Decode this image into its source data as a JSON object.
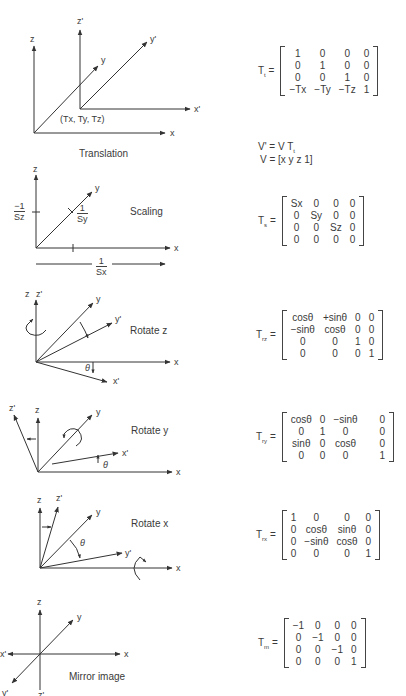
{
  "panels": {
    "translation": {
      "label": "Translation",
      "axis_labels": {
        "z": "z",
        "zp": "z'",
        "y": "y",
        "yp": "y'",
        "x": "x",
        "xp": "x'"
      },
      "offset_label": "(Tx, Ty, Tz)",
      "matrix_name": "T",
      "matrix_sub": "t",
      "matrix": [
        [
          "1",
          "0",
          "0",
          "0"
        ],
        [
          "0",
          "1",
          "0",
          "0"
        ],
        [
          "0",
          "0",
          "1",
          "0"
        ],
        [
          "−Tx",
          "−Ty",
          "−Tz",
          "1"
        ]
      ],
      "equation_1": "V' = V T",
      "equation_1_sub": "t",
      "equation_2": "V = [x  y  z  1]"
    },
    "scaling": {
      "label": "Scaling",
      "axis_labels": {
        "z": "z",
        "y": "y",
        "x": "x"
      },
      "z_tick": {
        "num": "−1",
        "den": "Sz"
      },
      "y_tick": {
        "num": "1",
        "den": "Sy"
      },
      "x_tick": {
        "num": "1",
        "den": "Sx"
      },
      "matrix_name": "T",
      "matrix_sub": "s",
      "matrix": [
        [
          "Sx",
          "0",
          "0",
          "0"
        ],
        [
          "0",
          "Sy",
          "0",
          "0"
        ],
        [
          "0",
          "0",
          "Sz",
          "0"
        ],
        [
          "0",
          "0",
          "0",
          "0"
        ]
      ]
    },
    "rotate_z": {
      "label": "Rotate z",
      "axis_labels": {
        "z": "z",
        "zp": "z'",
        "y": "y",
        "yp": "y'",
        "x": "x",
        "xp": "x'",
        "theta": "θ"
      },
      "matrix_name": "T",
      "matrix_sub": "rz",
      "matrix": [
        [
          "cosθ",
          "+sinθ",
          "0",
          "0"
        ],
        [
          "−sinθ",
          "cosθ",
          "0",
          "0"
        ],
        [
          "0",
          "0",
          "1",
          "0"
        ],
        [
          "0",
          "0",
          "0",
          "1"
        ]
      ]
    },
    "rotate_y": {
      "label": "Rotate y",
      "axis_labels": {
        "z": "z",
        "zp": "z'",
        "y": "y",
        "x": "x",
        "xp": "x'",
        "theta": "θ"
      },
      "matrix_name": "T",
      "matrix_sub": "ry",
      "matrix": [
        [
          "cosθ",
          "0",
          "−sinθ",
          "0"
        ],
        [
          "0",
          "1",
          "0",
          "0"
        ],
        [
          "sinθ",
          "0",
          "cosθ",
          "0"
        ],
        [
          "0",
          "0",
          "0",
          "1"
        ]
      ]
    },
    "rotate_x": {
      "label": "Rotate x",
      "axis_labels": {
        "z": "z",
        "zp": "z'",
        "y": "y",
        "yp": "y'",
        "x": "x",
        "theta": "θ"
      },
      "matrix_name": "T",
      "matrix_sub": "rx",
      "matrix": [
        [
          "1",
          "0",
          "0",
          "0"
        ],
        [
          "0",
          "cosθ",
          "sinθ",
          "0"
        ],
        [
          "0",
          "−sinθ",
          "cosθ",
          "0"
        ],
        [
          "0",
          "0",
          "0",
          "1"
        ]
      ]
    },
    "mirror": {
      "label": "Mirror image",
      "axis_labels": {
        "z": "z",
        "y": "y",
        "x": "x",
        "xp": "x'",
        "yp": "y'",
        "zp": "z'"
      },
      "matrix_name": "T",
      "matrix_sub": "m",
      "matrix": [
        [
          "−1",
          "0",
          "0",
          "0"
        ],
        [
          "0",
          "−1",
          "0",
          "0"
        ],
        [
          "0",
          "0",
          "−1",
          "0"
        ],
        [
          "0",
          "0",
          "0",
          "1"
        ]
      ]
    }
  }
}
